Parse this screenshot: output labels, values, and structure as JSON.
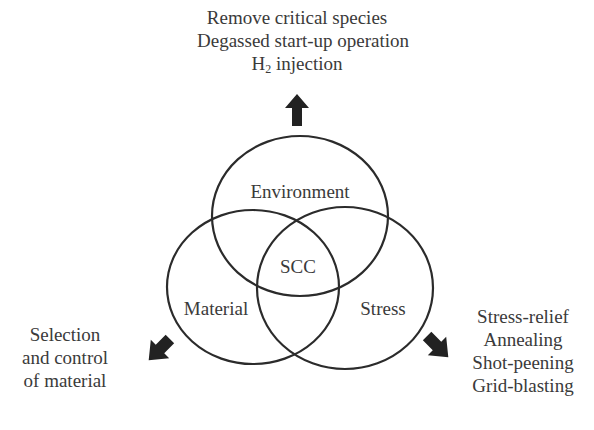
{
  "diagram": {
    "center_label": "SCC",
    "circles": [
      {
        "label": "Environment",
        "cx": 300,
        "cy": 216,
        "rx": 88,
        "ry": 80
      },
      {
        "label": "Material",
        "cx": 253,
        "cy": 287,
        "rx": 86,
        "ry": 77
      },
      {
        "label": "Stress",
        "cx": 345,
        "cy": 288,
        "rx": 88,
        "ry": 81
      }
    ],
    "colors": {
      "stroke": "#2b2b2b",
      "text": "#3a3a3a",
      "arrow": "#222222"
    }
  },
  "environment_actions": {
    "line1": "Remove critical species",
    "line2": "Degassed start-up operation",
    "line3_prefix": "H",
    "line3_sub": "2",
    "line3_suffix": " injection",
    "arrow": "arrow-up"
  },
  "material_actions": {
    "line1": "Selection",
    "line2": "and control",
    "line3": "of material",
    "arrow": "arrow-down-left"
  },
  "stress_actions": {
    "line1": "Stress-relief",
    "line2": "Annealing",
    "line3": "Shot-peening",
    "line4": "Grid-blasting",
    "arrow": "arrow-down-right"
  }
}
